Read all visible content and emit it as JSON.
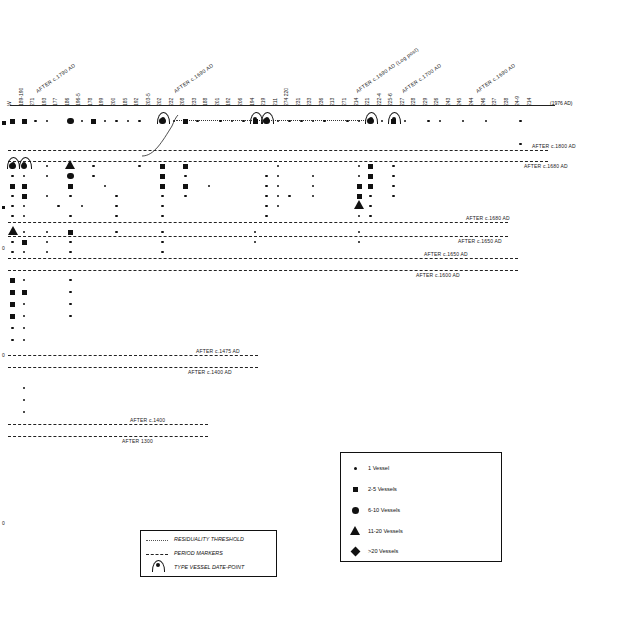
{
  "chart_data": {
    "type": "scatter",
    "title": "",
    "xlabel": "Vessel / context sequence number",
    "ylabel": "",
    "axis_right_label": "(1976 AD)",
    "x_tick_labels": [
      "W",
      "189-190",
      "271",
      "193",
      "177",
      "186",
      "196-5",
      "178",
      "199",
      "200",
      "185",
      "192",
      "203-5",
      "202",
      "232",
      "208",
      "233",
      "188",
      "201",
      "192",
      "206",
      "194",
      "219",
      "211",
      "274  220",
      "231",
      "233",
      "236",
      "213",
      "271",
      "214",
      "221",
      "222-4",
      "225-6",
      "227",
      "228",
      "229",
      "226",
      "243",
      "245",
      "244",
      "246",
      "237",
      "238",
      "24-9",
      "214"
    ],
    "diagonal_labels": [
      {
        "text": "AFTER c.1790 AD",
        "x": 38,
        "y": 88
      },
      {
        "text": "AFTER c.1690 AD",
        "x": 176,
        "y": 88
      },
      {
        "text": "AFTER c.1690 AD (Log post)",
        "x": 358,
        "y": 88
      },
      {
        "text": "AFTER c.1700 AD",
        "x": 404,
        "y": 88
      },
      {
        "text": "AFTER c.1690 AD",
        "x": 478,
        "y": 88
      }
    ],
    "period_bands": [
      {
        "upper": "AFTER c.1800 AD",
        "lower": "AFTER c.1680 AD",
        "y_upper": 150,
        "y_lower": 161
      },
      {
        "upper": "AFTER c.1680 AD",
        "lower": "AFTER c.1650 AD",
        "y_upper": 222,
        "y_lower": 236
      },
      {
        "upper": "AFTER c.1650 AD",
        "lower": "AFTER c.1600 AD",
        "y_upper": 258,
        "y_lower": 270
      },
      {
        "upper": "AFTER c.1475 AD",
        "lower": "AFTER c.1400 AD",
        "y_upper": 355,
        "y_lower": 367
      },
      {
        "upper": "AFTER c.1400",
        "lower": "AFTER 1300",
        "y_upper": 424,
        "y_lower": 436
      }
    ],
    "legend_symbols": {
      "title": "",
      "items": [
        {
          "symbol": "dot-1",
          "label": "1 Vessel"
        },
        {
          "symbol": "dot-2",
          "label": "2-5 Vessels"
        },
        {
          "symbol": "dot-3",
          "label": "6-10 Vessels"
        },
        {
          "symbol": "triangle",
          "label": "11-20 Vessels"
        },
        {
          "symbol": "diamond",
          "label": ">20 Vessels"
        }
      ]
    },
    "legend_lines": {
      "items": [
        {
          "symbol": "dotted-line",
          "label": "RESIDUALITY THRESHOLD"
        },
        {
          "symbol": "dashed-line",
          "label": "PERIOD MARKERS"
        },
        {
          "symbol": "arch-marker",
          "label": "TYPE VESSEL DATE-POINT"
        }
      ]
    }
  },
  "legend_symbols_title": "",
  "footer": {}
}
